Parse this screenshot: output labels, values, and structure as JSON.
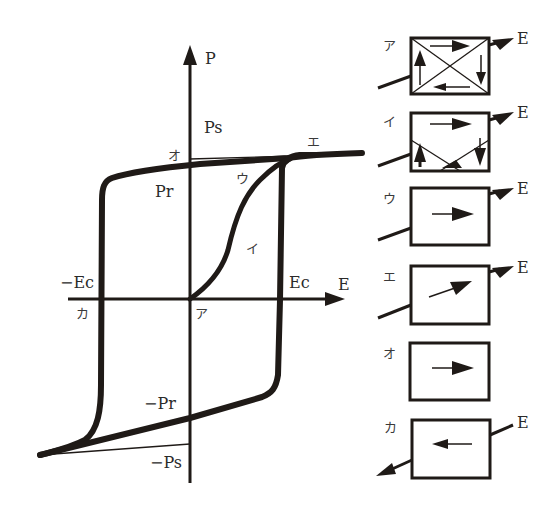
{
  "figure": {
    "type": "ferroelectric hysteresis loop with domain diagrams",
    "axes": {
      "y_label": "P",
      "x_label": "E"
    },
    "axis_labels": {
      "ps": "Ps",
      "pr": "Pr",
      "neg_pr": "−Pr",
      "neg_ps": "−Ps",
      "ec": "Ec",
      "neg_ec": "−Ec"
    },
    "curve_points": {
      "a": "ア",
      "i": "イ",
      "u": "ウ",
      "e": "エ",
      "o": "オ",
      "ka": "カ"
    },
    "colors": {
      "ink": "#1f1a17",
      "background": "#ffffff"
    }
  },
  "domain_boxes": [
    {
      "label": "ア",
      "field_label": "E",
      "description": "four domains, polarization circulating (no net)"
    },
    {
      "label": "イ",
      "field_label": "E",
      "description": "domains partially aligned with field"
    },
    {
      "label": "ウ",
      "field_label": "E",
      "description": "single domain, polarization along field"
    },
    {
      "label": "エ",
      "field_label": "E",
      "description": "single domain, polarization tilted toward field"
    },
    {
      "label": "オ",
      "field_label": "",
      "description": "remanent single domain, no field"
    },
    {
      "label": "カ",
      "field_label": "E",
      "description": "reverse field, polarization reversed"
    }
  ]
}
